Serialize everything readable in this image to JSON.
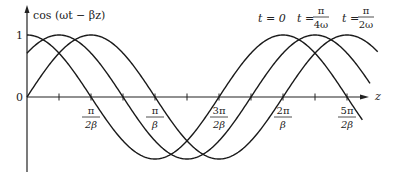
{
  "chart_data": {
    "type": "line",
    "title": "",
    "ylabel": "cos (ωt − βz)",
    "xlabel": "z",
    "y_ticks": [
      {
        "label": "1",
        "value": 1
      },
      {
        "label": "0",
        "value": 0
      }
    ],
    "x_ticks": [
      {
        "num": "π",
        "den": "2β",
        "value_over_pi_beta": 0.5
      },
      {
        "num": "π",
        "den": "β",
        "value_over_pi_beta": 1.0
      },
      {
        "num": "3π",
        "den": "2β",
        "value_over_pi_beta": 1.5
      },
      {
        "num": "2π",
        "den": "β",
        "value_over_pi_beta": 2.0
      },
      {
        "num": "5π",
        "den": "2β",
        "value_over_pi_beta": 2.5
      }
    ],
    "minor_ticks_over_pi_beta": [
      0.25,
      0.75,
      1.25,
      1.75,
      2.25
    ],
    "ylim": [
      -1,
      1
    ],
    "xlim_over_pi_beta": [
      0,
      2.6
    ],
    "grid": false,
    "series": [
      {
        "name": "t = 0",
        "label_left": "t = 0",
        "phase": 0,
        "formula": "cos(βz)",
        "start_value": 1.0
      },
      {
        "name": "t = π/4ω",
        "label_left": "t =",
        "label_num": "π",
        "label_den": "4ω",
        "phase": 0.7854,
        "formula": "cos(π/4 − βz)",
        "start_value": 0.707
      },
      {
        "name": "t = π/2ω",
        "label_left": "t =",
        "label_num": "π",
        "label_den": "2ω",
        "phase": 1.5708,
        "formula": "cos(π/2 − βz)",
        "start_value": 0.0
      }
    ]
  },
  "labels": {
    "y_axis": "cos (ωt − βz)",
    "x_axis": "z",
    "y_one": "1",
    "y_zero": "0",
    "legend_t0": "t = 0",
    "legend_t1_left": "t =",
    "legend_t1_num": "π",
    "legend_t1_den": "4ω",
    "legend_t2_left": "t =",
    "legend_t2_num": "π",
    "legend_t2_den": "2ω"
  }
}
